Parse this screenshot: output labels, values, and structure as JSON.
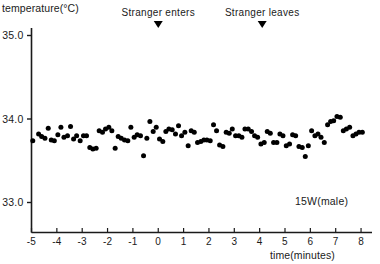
{
  "chart_data": {
    "type": "scatter",
    "title": "",
    "xlabel": "time(minutes)",
    "ylabel": "temperature(°C)",
    "xlim": [
      -5,
      8.3
    ],
    "ylim": [
      32.6,
      35.3
    ],
    "xticks": [
      -5,
      -4,
      -3,
      -2,
      -1,
      0,
      1,
      2,
      3,
      4,
      5,
      6,
      7,
      8
    ],
    "xtick_labels": [
      "-5",
      "-4",
      "-3",
      "-2",
      "-1",
      "0",
      "1",
      "2",
      "3",
      "4",
      "5",
      "6",
      "7",
      "8"
    ],
    "yticks": [
      33.0,
      34.0,
      35.0
    ],
    "ytick_labels": [
      "33.0",
      "34.0",
      "35.0"
    ],
    "grid": false,
    "legend": false,
    "series_label": "15W(male)",
    "marker": "filled-circle",
    "marker_color": "#000000",
    "annotations": [
      {
        "text": "Stranger enters",
        "x": 0.0,
        "marker": "down-triangle"
      },
      {
        "text": "Stranger leaves",
        "x": 4.1,
        "marker": "down-triangle"
      }
    ],
    "points": [
      [
        -4.95,
        33.74
      ],
      [
        -4.72,
        33.82
      ],
      [
        -4.6,
        33.79
      ],
      [
        -4.47,
        33.77
      ],
      [
        -4.34,
        33.89
      ],
      [
        -4.22,
        33.75
      ],
      [
        -4.1,
        33.74
      ],
      [
        -3.96,
        33.81
      ],
      [
        -3.84,
        33.9
      ],
      [
        -3.72,
        33.78
      ],
      [
        -3.58,
        33.8
      ],
      [
        -3.46,
        33.91
      ],
      [
        -3.34,
        33.76
      ],
      [
        -3.22,
        33.8
      ],
      [
        -3.08,
        33.74
      ],
      [
        -2.95,
        33.8
      ],
      [
        -2.83,
        33.8
      ],
      [
        -2.7,
        33.66
      ],
      [
        -2.58,
        33.64
      ],
      [
        -2.45,
        33.65
      ],
      [
        -2.33,
        33.86
      ],
      [
        -2.2,
        33.84
      ],
      [
        -2.08,
        33.88
      ],
      [
        -1.95,
        33.9
      ],
      [
        -1.83,
        33.86
      ],
      [
        -1.7,
        33.65
      ],
      [
        -1.58,
        33.79
      ],
      [
        -1.46,
        33.77
      ],
      [
        -1.33,
        33.75
      ],
      [
        -1.2,
        33.74
      ],
      [
        -1.08,
        33.9
      ],
      [
        -0.95,
        33.78
      ],
      [
        -0.83,
        33.81
      ],
      [
        -0.7,
        33.8
      ],
      [
        -0.58,
        33.56
      ],
      [
        -0.45,
        33.77
      ],
      [
        -0.33,
        33.97
      ],
      [
        -0.2,
        33.85
      ],
      [
        -0.08,
        33.9
      ],
      [
        0.05,
        33.76
      ],
      [
        0.18,
        33.73
      ],
      [
        0.3,
        33.85
      ],
      [
        0.42,
        33.88
      ],
      [
        0.55,
        33.87
      ],
      [
        0.68,
        33.82
      ],
      [
        0.8,
        33.92
      ],
      [
        0.92,
        33.8
      ],
      [
        1.05,
        33.84
      ],
      [
        1.18,
        33.68
      ],
      [
        1.3,
        33.86
      ],
      [
        1.42,
        33.84
      ],
      [
        1.55,
        33.72
      ],
      [
        1.68,
        33.73
      ],
      [
        1.8,
        33.75
      ],
      [
        1.92,
        33.75
      ],
      [
        2.05,
        33.74
      ],
      [
        2.18,
        33.93
      ],
      [
        2.3,
        33.86
      ],
      [
        2.42,
        33.69
      ],
      [
        2.55,
        33.67
      ],
      [
        2.68,
        33.84
      ],
      [
        2.8,
        33.83
      ],
      [
        2.92,
        33.88
      ],
      [
        3.05,
        33.8
      ],
      [
        3.18,
        33.8
      ],
      [
        3.3,
        33.78
      ],
      [
        3.42,
        33.88
      ],
      [
        3.55,
        33.88
      ],
      [
        3.68,
        33.85
      ],
      [
        3.8,
        33.8
      ],
      [
        3.92,
        33.78
      ],
      [
        4.05,
        33.7
      ],
      [
        4.18,
        33.72
      ],
      [
        4.3,
        33.85
      ],
      [
        4.42,
        33.83
      ],
      [
        4.55,
        33.72
      ],
      [
        4.68,
        33.72
      ],
      [
        4.8,
        33.82
      ],
      [
        4.92,
        33.8
      ],
      [
        5.05,
        33.68
      ],
      [
        5.18,
        33.7
      ],
      [
        5.3,
        33.81
      ],
      [
        5.42,
        33.8
      ],
      [
        5.55,
        33.67
      ],
      [
        5.68,
        33.66
      ],
      [
        5.8,
        33.55
      ],
      [
        5.92,
        33.68
      ],
      [
        6.05,
        33.86
      ],
      [
        6.18,
        33.8
      ],
      [
        6.3,
        33.82
      ],
      [
        6.42,
        33.78
      ],
      [
        6.55,
        33.72
      ],
      [
        6.68,
        33.93
      ],
      [
        6.8,
        33.97
      ],
      [
        6.92,
        33.98
      ],
      [
        7.05,
        34.03
      ],
      [
        7.18,
        34.02
      ],
      [
        7.3,
        33.86
      ],
      [
        7.42,
        33.88
      ],
      [
        7.55,
        33.9
      ],
      [
        7.68,
        33.8
      ],
      [
        7.8,
        33.82
      ],
      [
        7.92,
        33.84
      ],
      [
        8.05,
        33.84
      ]
    ]
  }
}
